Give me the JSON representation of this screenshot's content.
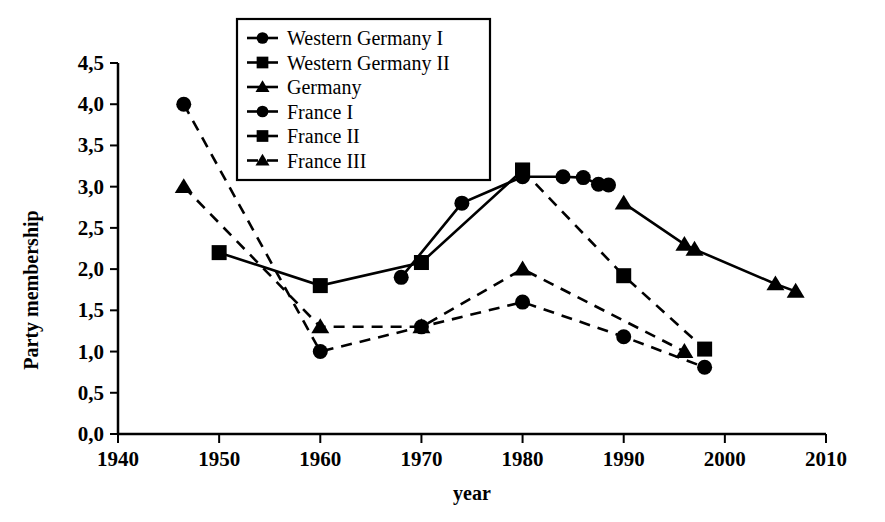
{
  "chart_data": {
    "type": "line",
    "title": "",
    "xlabel": "year",
    "ylabel": "Party membership",
    "xlim": [
      1940,
      2010
    ],
    "ylim": [
      0.0,
      4.5
    ],
    "xticks": [
      "1940",
      "1950",
      "1960",
      "1970",
      "1980",
      "1990",
      "2000",
      "2010"
    ],
    "xtick_values": [
      1940,
      1950,
      1960,
      1970,
      1980,
      1990,
      2000,
      2010
    ],
    "yticks": [
      "0,0",
      "0,5",
      "1,0",
      "1,5",
      "2,0",
      "2,5",
      "3,0",
      "3,5",
      "4,0",
      "4,5"
    ],
    "ytick_values": [
      0.0,
      0.5,
      1.0,
      1.5,
      2.0,
      2.5,
      3.0,
      3.5,
      4.0,
      4.5
    ],
    "grid": false,
    "legend_position": "top-center",
    "decimal_separator": ",",
    "series": [
      {
        "name": "Western Germany I",
        "marker": "circle",
        "linestyle": "solid",
        "color": "#000000",
        "x": [
          1968,
          1974,
          1980,
          1984,
          1986,
          1987.5,
          1988.5
        ],
        "values": [
          1.9,
          2.8,
          3.12,
          3.12,
          3.11,
          3.03,
          3.02
        ]
      },
      {
        "name": "Western Germany II",
        "marker": "square",
        "linestyle": "solid",
        "color": "#000000",
        "x": [
          1950,
          1960,
          1970,
          1980
        ],
        "values": [
          2.2,
          1.8,
          2.08,
          3.2
        ]
      },
      {
        "name": "Germany",
        "marker": "triangle",
        "linestyle": "solid",
        "color": "#000000",
        "x": [
          1990,
          1996,
          1997,
          2005,
          2007
        ],
        "values": [
          2.8,
          2.3,
          2.24,
          1.82,
          1.73
        ]
      },
      {
        "name": "France I",
        "marker": "circle",
        "linestyle": "dashed",
        "color": "#000000",
        "x": [
          1946.5,
          1960,
          1970,
          1980,
          1990,
          1998
        ],
        "values": [
          4.0,
          1.0,
          1.3,
          1.6,
          1.18,
          0.81
        ]
      },
      {
        "name": "France II",
        "marker": "square",
        "linestyle": "dashed",
        "color": "#000000",
        "x": [
          1980,
          1990,
          1998
        ],
        "values": [
          3.2,
          1.92,
          1.03
        ]
      },
      {
        "name": "France III",
        "marker": "triangle",
        "linestyle": "dashed",
        "color": "#000000",
        "x": [
          1946.5,
          1960,
          1970,
          1980,
          1996
        ],
        "values": [
          3.0,
          1.3,
          1.3,
          2.0,
          1.0
        ]
      }
    ],
    "legend_entries": [
      {
        "label": "Western Germany I",
        "marker": "circle",
        "linestyle": "solid"
      },
      {
        "label": "Western Germany II",
        "marker": "square",
        "linestyle": "solid"
      },
      {
        "label": "Germany",
        "marker": "triangle",
        "linestyle": "solid"
      },
      {
        "label": "France I",
        "marker": "circle",
        "linestyle": "dashed"
      },
      {
        "label": "France II",
        "marker": "square",
        "linestyle": "dashed"
      },
      {
        "label": "France III",
        "marker": "triangle",
        "linestyle": "dashed"
      }
    ]
  }
}
